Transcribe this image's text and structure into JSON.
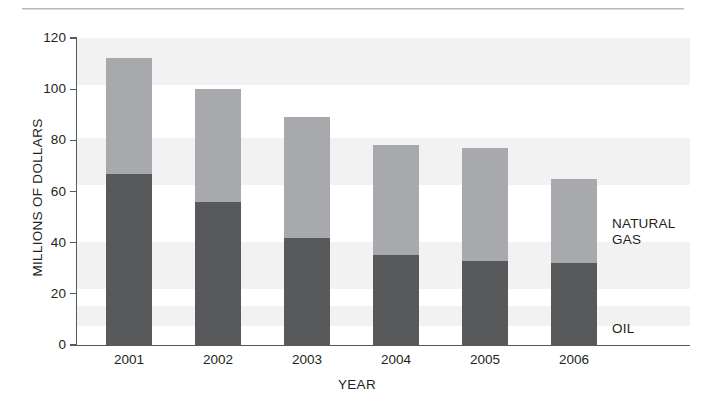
{
  "chart_data": {
    "type": "bar",
    "subtype": "stacked-vertical",
    "title": "",
    "xlabel": "YEAR",
    "ylabel": "MILLIONS OF DOLLARS",
    "categories": [
      "2001",
      "2002",
      "2003",
      "2004",
      "2005",
      "2006"
    ],
    "ylim": [
      0,
      120
    ],
    "yticks": [
      0,
      20,
      40,
      60,
      80,
      100,
      120
    ],
    "ytick_labels": [
      "0",
      "20",
      "40",
      "60",
      "80",
      "100",
      "120"
    ],
    "grid": false,
    "legend_position": "inline-right",
    "series": [
      {
        "name": "OIL",
        "color": "#58595b",
        "values": [
          67,
          56,
          42,
          35,
          33,
          32
        ]
      },
      {
        "name": "NATURAL GAS",
        "color": "#a7a9ac",
        "values": [
          45,
          44,
          47,
          43,
          44,
          33
        ]
      }
    ],
    "totals": [
      112,
      100,
      89,
      78,
      77,
      65
    ],
    "annotations": [
      {
        "text": "NATURAL\nGAS",
        "series": "NATURAL GAS"
      },
      {
        "text": "OIL",
        "series": "OIL"
      }
    ]
  },
  "axes": {
    "y_title": "MILLIONS OF DOLLARS",
    "x_title": "YEAR",
    "y_labels": [
      "120",
      "100",
      "80",
      "60",
      "40",
      "20",
      "0"
    ],
    "x_labels": [
      "2001",
      "2002",
      "2003",
      "2004",
      "2005",
      "2006"
    ]
  },
  "legend": {
    "natural_gas": "NATURAL\nGAS",
    "oil": "OIL"
  },
  "colors": {
    "oil": "#58595b",
    "natural_gas": "#a7a9ac",
    "axis": "#58595b",
    "band": "#f2f2f2",
    "text": "#231f20",
    "rule": "#b9b9b9"
  }
}
